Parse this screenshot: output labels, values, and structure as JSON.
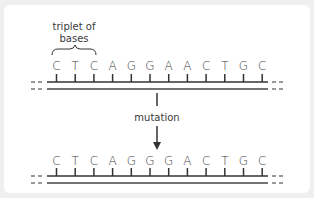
{
  "diagram": {
    "title_annotation": {
      "line1": "triplet of",
      "line2": "bases"
    },
    "original_sequence": {
      "bases": [
        "C",
        "T",
        "C",
        "A",
        "G",
        "G",
        "A",
        "A",
        "C",
        "T",
        "G",
        "C"
      ]
    },
    "arrow_label": "mutation",
    "mutated_sequence": {
      "bases": [
        "C",
        "T",
        "C",
        "A",
        "G",
        "G",
        "G",
        "A",
        "C",
        "T",
        "G",
        "C"
      ]
    },
    "colors": {
      "text": "#3a3a3a",
      "line": "#333333",
      "background": "#efefef",
      "card": "#ffffff"
    }
  }
}
